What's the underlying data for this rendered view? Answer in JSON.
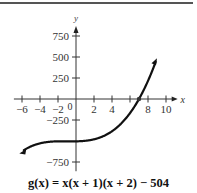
{
  "caption": "g(x) = x(x + 1)(x + 2) − 504",
  "chart_data": {
    "type": "line",
    "title": "",
    "caption": "g(x) = x(x + 1)(x + 2) − 504",
    "xlabel": "x",
    "ylabel": "y",
    "xlim": [
      -7,
      11
    ],
    "ylim": [
      -900,
      900
    ],
    "x_ticks": [
      -6,
      -4,
      -2,
      2,
      4,
      8,
      10
    ],
    "x_tick_labels": [
      "−6",
      "−4",
      "−2",
      "2",
      "4",
      "8",
      "10"
    ],
    "origin_label": "0",
    "y_ticks": [
      750,
      500,
      250,
      -250,
      -750
    ],
    "y_tick_labels": [
      "750",
      "500",
      "250",
      "−250",
      "−750"
    ],
    "grid": false,
    "legend": null,
    "annotations": [
      {
        "type": "point",
        "x": 7,
        "y": 0,
        "label": "zero"
      }
    ],
    "series": [
      {
        "name": "g(x)",
        "formula": "x(x+1)(x+2) - 504",
        "x": [
          -6,
          -5,
          -4,
          -3,
          -2,
          -1,
          0,
          1,
          2,
          3,
          4,
          5,
          6,
          7,
          8,
          8.8
        ],
        "values": [
          -624,
          -564,
          -528,
          -510,
          -504,
          -504,
          -504,
          -498,
          -480,
          -444,
          -384,
          -294,
          -168,
          0,
          216,
          480
        ]
      }
    ]
  }
}
